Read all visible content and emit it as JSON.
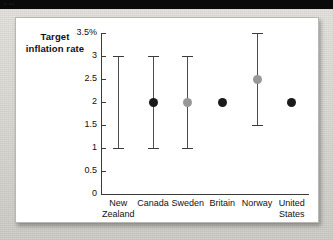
{
  "top_band": {
    "faint_marks": "▫ ▫▫"
  },
  "chart_data": {
    "type": "scatter",
    "title": "",
    "subtitle": "",
    "ylabel": "Target inflation rate",
    "xlabel": "",
    "ylim": [
      0,
      3.5
    ],
    "grid": false,
    "legend": null,
    "y_ticks": [
      {
        "value": 3.5,
        "label": "3.5%"
      },
      {
        "value": 3,
        "label": "3"
      },
      {
        "value": 2.5,
        "label": "2.5"
      },
      {
        "value": 2,
        "label": "2"
      },
      {
        "value": 1.5,
        "label": "1.5"
      },
      {
        "value": 1,
        "label": "1"
      },
      {
        "value": 0.5,
        "label": "0.5"
      },
      {
        "value": 0,
        "label": "0"
      }
    ],
    "categories": [
      "New Zealand",
      "Canada",
      "Sweden",
      "Britain",
      "Norway",
      "United States"
    ],
    "points": [
      {
        "category": "New Zealand",
        "label_line1": "New",
        "label_line2": "Zealand",
        "low": 1,
        "high": 3,
        "target": null,
        "target_color": null
      },
      {
        "category": "Canada",
        "label_line1": "Canada",
        "label_line2": "",
        "low": 1,
        "high": 3,
        "target": 2,
        "target_color": "#1a1a1a"
      },
      {
        "category": "Sweden",
        "label_line1": "Sweden",
        "label_line2": "",
        "low": 1,
        "high": 3,
        "target": 2,
        "target_color": "#989898"
      },
      {
        "category": "Britain",
        "label_line1": "Britain",
        "label_line2": "",
        "low": null,
        "high": null,
        "target": 2,
        "target_color": "#1a1a1a"
      },
      {
        "category": "Norway",
        "label_line1": "Norway",
        "label_line2": "",
        "low": 1.5,
        "high": 3.5,
        "target": 2.5,
        "target_color": "#989898"
      },
      {
        "category": "United States",
        "label_line1": "United",
        "label_line2": "States",
        "low": null,
        "high": null,
        "target": 2,
        "target_color": "#1a1a1a"
      }
    ],
    "colors": {
      "axis": "#3b3b3b",
      "range_bar": "#4d4d4d",
      "marker_dark": "#1a1a1a",
      "marker_gray": "#989898",
      "panel_bg": "#ffffff",
      "page_bg": "#dbd9d4"
    }
  }
}
